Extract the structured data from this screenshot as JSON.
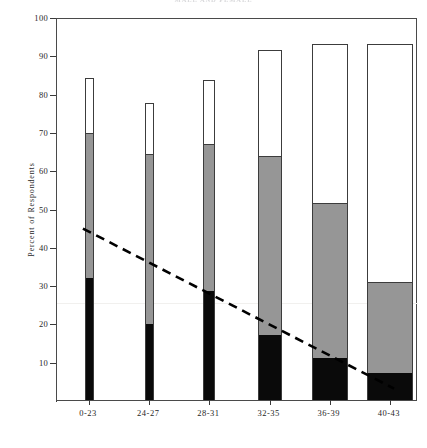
{
  "header": {
    "partial_title": "MALE AND FEMALE"
  },
  "chart_data": {
    "type": "bar",
    "title": "",
    "subtitle": "",
    "xlabel": "",
    "ylabel": "Percent of Respondents",
    "ylim": [
      0,
      100
    ],
    "yticks": [
      10,
      20,
      30,
      40,
      50,
      60,
      70,
      80,
      90,
      100
    ],
    "grid": false,
    "legend_position": "none",
    "stacked": true,
    "categories": [
      "0-23",
      "24-27",
      "28-31",
      "32-35",
      "36-39",
      "40-43"
    ],
    "series": [
      {
        "name": "black-segment",
        "color": "#0a0a0a",
        "values": [
          32,
          20,
          28.5,
          17,
          11,
          7
        ]
      },
      {
        "name": "gray-segment",
        "color": "#969696",
        "values": [
          38,
          44.5,
          38.5,
          47,
          40.5,
          24
        ]
      },
      {
        "name": "white-segment",
        "color": "#ffffff",
        "values": [
          14,
          13,
          16.5,
          27.5,
          41.5,
          62
        ]
      }
    ],
    "cumulative_tops": {
      "black_top": [
        32,
        20,
        28.5,
        17,
        11,
        7
      ],
      "gray_top": [
        70,
        64.5,
        67,
        64,
        51.5,
        31
      ],
      "total": [
        84,
        77.5,
        83.5,
        91.5,
        93,
        93
      ]
    },
    "bar_widths_px": [
      9,
      9,
      12,
      24,
      36,
      46
    ],
    "trend_line": {
      "type": "line",
      "style": "dashed",
      "color": "#000000",
      "x_start_category": "0-23",
      "x_end_category": "40-43",
      "y_start": 45,
      "y_end": 3
    }
  },
  "axis": {
    "y_tick_labels": [
      "100",
      "90",
      "80",
      "70",
      "60",
      "50",
      "40",
      "30",
      "20",
      "10"
    ],
    "y_title": "Percent of Respondents",
    "x_tick_labels": [
      "0-23",
      "24-27",
      "28-31",
      "32-35",
      "36-39",
      "40-43"
    ]
  }
}
